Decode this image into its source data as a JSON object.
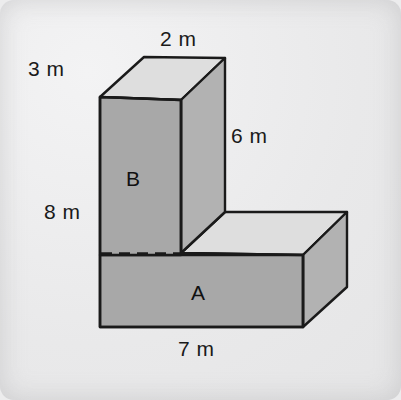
{
  "figure": {
    "unit": "m",
    "colors": {
      "background": "#ececed",
      "front_face_fill": "#a8a8a8",
      "top_face_fill": "#dedede",
      "right_face_fill": "#b0b0b0",
      "outline": "#1a1a1a",
      "hidden_edge": "#1a1a1a",
      "text": "#1a1a1a"
    },
    "labels": {
      "top_width": "2 m",
      "depth": "3 m",
      "upper_height": "6 m",
      "total_height": "8 m",
      "base_width": "7 m",
      "part_b": "B",
      "part_a": "A"
    },
    "parts": [
      {
        "name": "B",
        "role": "upper vertical prism",
        "width": "2 m",
        "depth": "3 m",
        "height": "6 m"
      },
      {
        "name": "A",
        "role": "lower horizontal base prism",
        "width": "7 m",
        "depth": "3 m",
        "height": "2 m"
      }
    ],
    "dimensions": [
      {
        "id": "top_width",
        "value": 2,
        "unit": "m",
        "text": "2 m",
        "edge": "top-back edge of prism B"
      },
      {
        "id": "depth",
        "value": 3,
        "unit": "m",
        "text": "3 m",
        "edge": "top-left receding edge of prism B"
      },
      {
        "id": "upper_height",
        "value": 6,
        "unit": "m",
        "text": "6 m",
        "edge": "right vertical edge of prism B"
      },
      {
        "id": "total_height",
        "value": 8,
        "unit": "m",
        "text": "8 m",
        "edge": "left vertical edge of whole solid"
      },
      {
        "id": "base_width",
        "value": 7,
        "unit": "m",
        "text": "7 m",
        "edge": "bottom front edge of prism A"
      }
    ],
    "geometry": {
      "front_outline": "100,97 181,100 181,253 303,255 303,327 100,327",
      "b_top_face": "100,97 144,57 225,58 181,100",
      "b_right_face": "181,100 225,58 225,212 181,253",
      "a_top_face": "181,253 225,212 347,212 303,255",
      "a_right_face": "303,255 347,212 347,287 303,327",
      "hidden_edge": "100,253 181,253"
    }
  }
}
